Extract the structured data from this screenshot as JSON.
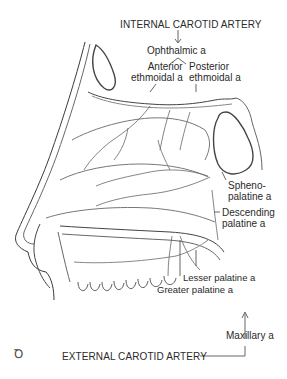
{
  "diagram": {
    "title_top": "INTERNAL CAROTID ARTERY",
    "title_bottom": "EXTERNAL CAROTID ARTERY",
    "labels": {
      "ophthalmic": "Ophthalmic a",
      "anterior_ethmoidal": "Anterior\nethmoidal a",
      "posterior_ethmoidal": "Posterior\nethmoidal a",
      "sphenopalatine": "Spheno-\npalatine a",
      "descending_palatine": "Descending\npalatine a",
      "lesser_palatine": "Lesser palatine a",
      "greater_palatine": "Greater palatine a",
      "maxillary": "Maxillary a"
    },
    "logo_glyph": "Ꝺ",
    "colors": {
      "line": "#555555",
      "text": "#2a2a2a",
      "background": "#ffffff"
    }
  }
}
